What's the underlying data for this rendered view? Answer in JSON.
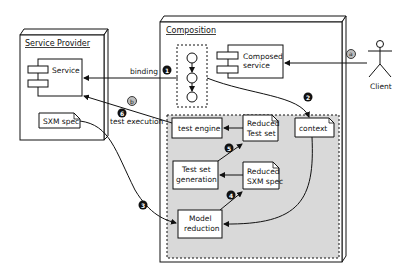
{
  "diagram": {
    "service_provider": {
      "title": "Service Provider",
      "service_label": "Service",
      "sxm_spec_label": "SXM spec"
    },
    "composition": {
      "title": "Composition",
      "composed_service_label_line1": "Composed",
      "composed_service_label_line2": "service",
      "context_label": "context",
      "test_engine_label": "test engine",
      "reduced_test_set_line1": "Reduced",
      "reduced_test_set_line2": "Test set",
      "test_set_generation_line1": "Test set",
      "test_set_generation_line2": "generation",
      "reduced_sxm_spec_line1": "Reduced",
      "reduced_sxm_spec_line2": "SXM spec",
      "model_reduction_line1": "Model",
      "model_reduction_line2": "reduction"
    },
    "client_label": "Client",
    "edges": {
      "binding_label": "binding",
      "test_execution_label": "test execution"
    },
    "badges": {
      "step1": "1",
      "step2": "2",
      "step3": "3",
      "step4": "4",
      "step5": "5",
      "step6": "6",
      "stepa": "a",
      "stepb": "b"
    },
    "colors": {
      "shaded_region": "#d9d9d9",
      "badge_dark": "#111111",
      "badge_light": "#bdbdbd",
      "line": "#111111"
    }
  }
}
